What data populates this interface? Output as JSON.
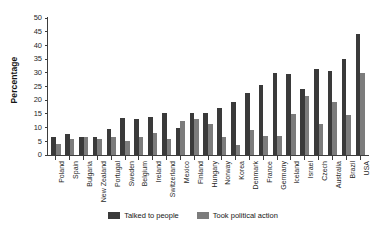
{
  "chart_data": {
    "type": "bar",
    "title": "",
    "xlabel": "",
    "ylabel": "Percentage",
    "ylim": [
      0,
      50
    ],
    "yticks": [
      0,
      5,
      10,
      15,
      20,
      25,
      30,
      35,
      40,
      45,
      50
    ],
    "grid": false,
    "legend_position": "bottom",
    "categories": [
      "Poland",
      "Spain",
      "Bulgaria",
      "New Zealand",
      "Portugal",
      "Sweden",
      "Belgium",
      "Ireland",
      "Switzerland",
      "Mexico",
      "Finland",
      "Hungary",
      "Norway",
      "Korea",
      "Denmark",
      "France",
      "Germany",
      "Iceland",
      "Israel",
      "Czech",
      "Australia",
      "Brazil",
      "USA"
    ],
    "series": [
      {
        "name": "Talked to people",
        "color": "#3a3a3a",
        "values": [
          6.5,
          7.5,
          6.5,
          6.5,
          9.5,
          13.5,
          13.0,
          14.0,
          15.5,
          10.0,
          15.5,
          15.5,
          17.0,
          19.5,
          22.5,
          25.5,
          30.0,
          29.5,
          24.0,
          31.5,
          30.5,
          35.0,
          44.0
        ]
      },
      {
        "name": "Took political action",
        "color": "#7c7c7c",
        "values": [
          4.0,
          6.0,
          6.5,
          6.0,
          6.5,
          5.0,
          6.5,
          8.0,
          6.0,
          12.5,
          13.0,
          11.5,
          6.5,
          3.5,
          9.0,
          7.0,
          7.0,
          15.0,
          21.5,
          11.5,
          19.5,
          14.5,
          30.0
        ]
      }
    ]
  },
  "legend": {
    "items": [
      {
        "label": "Talked to people",
        "color": "#3a3a3a"
      },
      {
        "label": "Took political action",
        "color": "#7c7c7c"
      }
    ]
  },
  "axes": {
    "y_title": "Percentage"
  }
}
